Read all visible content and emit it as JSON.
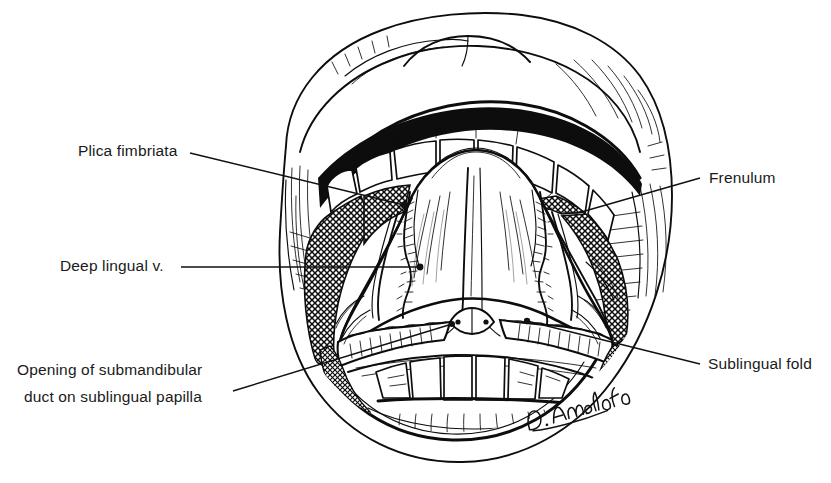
{
  "figure": {
    "kind": "anatomical-line-illustration",
    "background_color": "#ffffff",
    "ink_color": "#0d0d0d",
    "width": 831,
    "height": 483
  },
  "labels": [
    {
      "id": "plica-fimbriata",
      "text": "Plica fimbriata",
      "side": "left",
      "lines": [
        "Plica fimbriata"
      ],
      "text_anchor_x": 78,
      "text_anchor_y": 156,
      "leader_start_x": 190,
      "leader_start_y": 153,
      "leader_end_x": 404,
      "leader_end_y": 205,
      "endpoint_marker": "dot"
    },
    {
      "id": "deep-lingual-vein",
      "text": "Deep lingual v.",
      "side": "left",
      "lines": [
        "Deep lingual v."
      ],
      "text_anchor_x": 60,
      "text_anchor_y": 271,
      "leader_start_x": 181,
      "leader_start_y": 267,
      "leader_end_x": 420,
      "leader_end_y": 267,
      "endpoint_marker": "dot"
    },
    {
      "id": "opening-submandibular-duct",
      "text": "Opening of submandibular duct on sublingual papilla",
      "side": "left",
      "lines": [
        "Opening of submandibular",
        "duct on sublingual papilla"
      ],
      "text_anchor_x": 17,
      "text_anchor_y": 375,
      "line_height": 27,
      "leader_start_x": 233,
      "leader_start_y": 391,
      "leader_end_x": 452,
      "leader_end_y": 324,
      "endpoint_marker": "dot"
    },
    {
      "id": "frenulum",
      "text": "Frenulum",
      "side": "right",
      "lines": [
        "Frenulum"
      ],
      "text_anchor_x": 709,
      "text_anchor_y": 183,
      "leader_start_x": 700,
      "leader_start_y": 178,
      "leader_end_x": 578,
      "leader_end_y": 213,
      "endpoint_marker": "line"
    },
    {
      "id": "sublingual-fold",
      "text": "Sublingual fold",
      "side": "right",
      "lines": [
        "Sublingual fold"
      ],
      "text_anchor_x": 708,
      "text_anchor_y": 369,
      "leader_start_x": 700,
      "leader_start_y": 364,
      "leader_end_x": 527,
      "leader_end_y": 321,
      "endpoint_marker": "dot"
    }
  ],
  "signature": {
    "text": "D. Anedolfo",
    "style": "handwritten-cursive",
    "x": 528,
    "y": 428
  },
  "anatomy_parts": [
    "upper lip",
    "lower lip",
    "upper incisor teeth",
    "lower incisor teeth",
    "buccal mucosa (crosshatched)",
    "inferior surface of tongue",
    "lingual frenulum",
    "deep lingual vein",
    "plica fimbriata",
    "sublingual fold",
    "sublingual papilla with submandibular duct openings"
  ]
}
